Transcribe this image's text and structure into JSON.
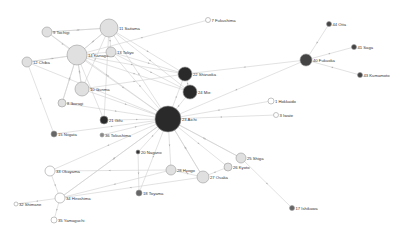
{
  "diagram": {
    "type": "directed-network",
    "nodes": [
      {
        "id": "11",
        "label": "11 Saitama",
        "x": 109,
        "y": 28,
        "r": 9,
        "fill": "#e0e0e0"
      },
      {
        "id": "9",
        "label": "9 Tochigi",
        "x": 47,
        "y": 32,
        "r": 5,
        "fill": "#e0e0e0"
      },
      {
        "id": "14",
        "label": "14 Kanagawa",
        "x": 77,
        "y": 55,
        "r": 10,
        "fill": "#e0e0e0"
      },
      {
        "id": "13",
        "label": "13 Tokyo",
        "x": 111,
        "y": 52,
        "r": 5,
        "fill": "#e0e0e0"
      },
      {
        "id": "12",
        "label": "12 Chiba",
        "x": 27,
        "y": 62,
        "r": 5,
        "fill": "#e0e0e0"
      },
      {
        "id": "7",
        "label": "7 Fukushima",
        "x": 208,
        "y": 20,
        "r": 2.5,
        "fill": "#ffffff"
      },
      {
        "id": "44",
        "label": "44 Oita",
        "x": 329,
        "y": 24,
        "r": 2.5,
        "fill": "#444444"
      },
      {
        "id": "41",
        "label": "41 Saga",
        "x": 354,
        "y": 47,
        "r": 2.5,
        "fill": "#444444"
      },
      {
        "id": "40",
        "label": "40 Fukuoka",
        "x": 306,
        "y": 60,
        "r": 6,
        "fill": "#444444"
      },
      {
        "id": "43",
        "label": "43 Kumamoto",
        "x": 360,
        "y": 75,
        "r": 2.5,
        "fill": "#444444"
      },
      {
        "id": "22",
        "label": "22 Shizuoka",
        "x": 185,
        "y": 74,
        "r": 7,
        "fill": "#2a2a2a"
      },
      {
        "id": "24",
        "label": "24 Mie",
        "x": 190,
        "y": 92,
        "r": 7,
        "fill": "#2a2a2a"
      },
      {
        "id": "10",
        "label": "10 Gunma",
        "x": 82,
        "y": 89,
        "r": 7,
        "fill": "#e0e0e0"
      },
      {
        "id": "8",
        "label": "8 Ibaragi",
        "x": 62,
        "y": 103,
        "r": 4,
        "fill": "#e0e0e0"
      },
      {
        "id": "23",
        "label": "23 Aichi",
        "x": 168,
        "y": 119,
        "r": 13,
        "fill": "#2a2a2a"
      },
      {
        "id": "21",
        "label": "21 Gifu",
        "x": 104,
        "y": 120,
        "r": 4,
        "fill": "#2a2a2a"
      },
      {
        "id": "1",
        "label": "1 Hokkaido",
        "x": 271,
        "y": 101,
        "r": 3,
        "fill": "#ffffff"
      },
      {
        "id": "3",
        "label": "3 Iwate",
        "x": 276,
        "y": 115,
        "r": 2.5,
        "fill": "#ffffff"
      },
      {
        "id": "15",
        "label": "15 Niigata",
        "x": 54,
        "y": 134,
        "r": 3,
        "fill": "#666666"
      },
      {
        "id": "36",
        "label": "36 Tokushima",
        "x": 102,
        "y": 135,
        "r": 2,
        "fill": "#888888"
      },
      {
        "id": "20",
        "label": "20 Nagano",
        "x": 138,
        "y": 152,
        "r": 2,
        "fill": "#333333"
      },
      {
        "id": "25",
        "label": "25 Shiga",
        "x": 241,
        "y": 158,
        "r": 5,
        "fill": "#e0e0e0"
      },
      {
        "id": "28",
        "label": "28 Hyogo",
        "x": 171,
        "y": 170,
        "r": 5,
        "fill": "#e0e0e0"
      },
      {
        "id": "26",
        "label": "26 Kyoto",
        "x": 228,
        "y": 167,
        "r": 4,
        "fill": "#e0e0e0"
      },
      {
        "id": "27",
        "label": "27 Osaka",
        "x": 203,
        "y": 177,
        "r": 6,
        "fill": "#e0e0e0"
      },
      {
        "id": "33",
        "label": "33 Okayama",
        "x": 50,
        "y": 171,
        "r": 5,
        "fill": "#ffffff"
      },
      {
        "id": "18",
        "label": "18 Toyama",
        "x": 139,
        "y": 193,
        "r": 3,
        "fill": "#666666"
      },
      {
        "id": "34",
        "label": "34 Hiroshima",
        "x": 60,
        "y": 198,
        "r": 5,
        "fill": "#ffffff"
      },
      {
        "id": "32",
        "label": "32 Shimane",
        "x": 16,
        "y": 204,
        "r": 2,
        "fill": "#ffffff"
      },
      {
        "id": "35",
        "label": "35 Yamaguchi",
        "x": 54,
        "y": 220,
        "r": 3,
        "fill": "#ffffff"
      },
      {
        "id": "17",
        "label": "17 Ishikawa",
        "x": 292,
        "y": 208,
        "r": 2.5,
        "fill": "#666666"
      }
    ],
    "edges": [
      [
        "11",
        "13"
      ],
      [
        "11",
        "14"
      ],
      [
        "11",
        "23"
      ],
      [
        "11",
        "22"
      ],
      [
        "11",
        "24"
      ],
      [
        "11",
        "10"
      ],
      [
        "11",
        "21"
      ],
      [
        "11",
        "9"
      ],
      [
        "9",
        "14"
      ],
      [
        "9",
        "23"
      ],
      [
        "9",
        "11"
      ],
      [
        "14",
        "23"
      ],
      [
        "14",
        "22"
      ],
      [
        "14",
        "24"
      ],
      [
        "14",
        "10"
      ],
      [
        "14",
        "8"
      ],
      [
        "14",
        "12"
      ],
      [
        "14",
        "21"
      ],
      [
        "14",
        "11"
      ],
      [
        "13",
        "23"
      ],
      [
        "13",
        "22"
      ],
      [
        "13",
        "14"
      ],
      [
        "13",
        "24"
      ],
      [
        "12",
        "14"
      ],
      [
        "12",
        "15"
      ],
      [
        "12",
        "23"
      ],
      [
        "7",
        "14"
      ],
      [
        "44",
        "40"
      ],
      [
        "41",
        "40"
      ],
      [
        "43",
        "40"
      ],
      [
        "40",
        "22"
      ],
      [
        "40",
        "23"
      ],
      [
        "22",
        "23"
      ],
      [
        "22",
        "24"
      ],
      [
        "24",
        "23"
      ],
      [
        "10",
        "23"
      ],
      [
        "10",
        "22"
      ],
      [
        "10",
        "14"
      ],
      [
        "8",
        "23"
      ],
      [
        "8",
        "14"
      ],
      [
        "21",
        "23"
      ],
      [
        "15",
        "23"
      ],
      [
        "36",
        "23"
      ],
      [
        "1",
        "23"
      ],
      [
        "3",
        "23"
      ],
      [
        "23",
        "20"
      ],
      [
        "23",
        "28"
      ],
      [
        "23",
        "27"
      ],
      [
        "23",
        "25"
      ],
      [
        "23",
        "26"
      ],
      [
        "23",
        "18"
      ],
      [
        "23",
        "33"
      ],
      [
        "23",
        "34"
      ],
      [
        "25",
        "17"
      ],
      [
        "25",
        "23"
      ],
      [
        "28",
        "27"
      ],
      [
        "28",
        "33"
      ],
      [
        "28",
        "34"
      ],
      [
        "26",
        "27"
      ],
      [
        "27",
        "34"
      ],
      [
        "27",
        "23"
      ],
      [
        "20",
        "18"
      ],
      [
        "33",
        "34"
      ],
      [
        "34",
        "32"
      ],
      [
        "34",
        "35"
      ],
      [
        "34",
        "23"
      ]
    ]
  }
}
